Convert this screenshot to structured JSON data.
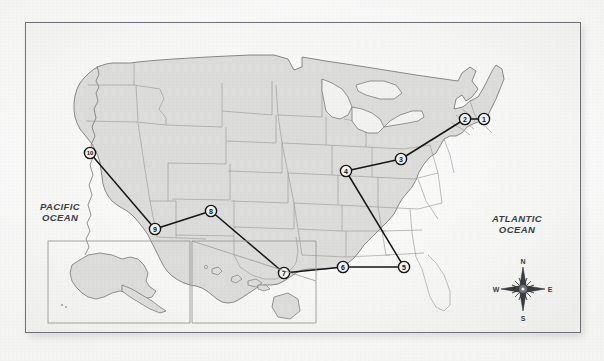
{
  "document": {
    "type": "map-figure",
    "title": "United States route map with ten numbered stops"
  },
  "frame": {
    "border_color": "#6e7276",
    "background_color": "#f7f7f6"
  },
  "labels": {
    "pacific_ocean": "PACIFIC\nOCEAN",
    "atlantic_ocean": "ATLANTIC\nOCEAN"
  },
  "compass": {
    "north": "N",
    "east": "E",
    "south": "S",
    "west": "W"
  },
  "insets": [
    {
      "name": "alaska-inset",
      "label": ""
    },
    {
      "name": "hawaii-inset",
      "label": ""
    }
  ],
  "map_style": {
    "land_fill": "#dcdcda",
    "state_border": "#9a9a98",
    "coastline": "#6f6f6d",
    "route_line": "#141618",
    "marker_fill": "#f2f2f0",
    "marker_stroke": "#141618"
  },
  "chart_data": {
    "type": "scatter",
    "xlabel": "",
    "ylabel": "",
    "markers": [
      {
        "id": "1",
        "label": "1",
        "x": 483,
        "y": 118
      },
      {
        "id": "2",
        "label": "2",
        "x": 464,
        "y": 118
      },
      {
        "id": "3",
        "label": "3",
        "x": 400,
        "y": 158
      },
      {
        "id": "4",
        "label": "4",
        "x": 345,
        "y": 170
      },
      {
        "id": "5",
        "label": "5",
        "x": 403,
        "y": 266
      },
      {
        "id": "6",
        "label": "6",
        "x": 342,
        "y": 266
      },
      {
        "id": "7",
        "label": "7",
        "x": 283,
        "y": 272
      },
      {
        "id": "8",
        "label": "8",
        "x": 210,
        "y": 210
      },
      {
        "id": "9",
        "label": "9",
        "x": 154,
        "y": 228
      },
      {
        "id": "10",
        "label": "10",
        "x": 89,
        "y": 152
      }
    ],
    "route_segments": [
      {
        "from": "1",
        "to": "2"
      },
      {
        "from": "2",
        "to": "3"
      },
      {
        "from": "3",
        "to": "4"
      },
      {
        "from": "4",
        "to": "5"
      },
      {
        "from": "5",
        "to": "6"
      },
      {
        "from": "6",
        "to": "7"
      },
      {
        "from": "7",
        "to": "8"
      },
      {
        "from": "8",
        "to": "9"
      },
      {
        "from": "9",
        "to": "10"
      }
    ]
  }
}
